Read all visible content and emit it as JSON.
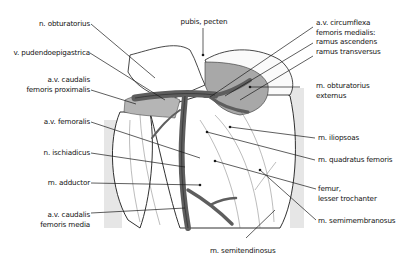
{
  "figure": {
    "type": "anatomical-diagram",
    "colors": {
      "background": "#ffffff",
      "panel_gray": "#e6e6e6",
      "muscle_gray": "#a8a8a8",
      "vessel_dark": "#5e5e5e",
      "outline": "#1a1a1a"
    }
  },
  "labels_left": [
    {
      "id": "n-obturatorius",
      "lines": [
        "n. obturatorius"
      ]
    },
    {
      "id": "v-pudendoepigastrica",
      "lines": [
        "v. pudendoepigastrica"
      ]
    },
    {
      "id": "av-caudalis-femoris-proximalis",
      "lines": [
        "a.v. caudalis",
        "femoris proximalis"
      ]
    },
    {
      "id": "av-femoralis",
      "lines": [
        "a.v. femoralis"
      ]
    },
    {
      "id": "n-ischiadicus",
      "lines": [
        "n. ischiadicus"
      ]
    },
    {
      "id": "m-adductor",
      "lines": [
        "m. adductor"
      ]
    },
    {
      "id": "av-caudalis-femoris-media",
      "lines": [
        "a.v. caudalis",
        "femoris media"
      ]
    }
  ],
  "labels_top": [
    {
      "id": "pubis-pecten",
      "lines": [
        "pubis, pecten"
      ]
    }
  ],
  "labels_right": [
    {
      "id": "av-circumflexa-femoris-medialis",
      "lines": [
        "a.v. circumflexa",
        "femoris medialis:",
        "ramus ascendens",
        "ramus transversus"
      ]
    },
    {
      "id": "m-obturatorius-externus",
      "lines": [
        "m. obturatorius",
        "externus"
      ]
    },
    {
      "id": "m-iliopsoas",
      "lines": [
        "m. iliopsoas"
      ]
    },
    {
      "id": "m-quadratus-femoris",
      "lines": [
        "m. quadratus femoris"
      ]
    },
    {
      "id": "femur-lesser-trochanter",
      "lines": [
        "femur,",
        "lesser trochanter"
      ]
    },
    {
      "id": "m-semimembranosus",
      "lines": [
        "m. semimembranosus"
      ]
    }
  ],
  "labels_bottom": [
    {
      "id": "m-semitendinosus",
      "lines": [
        "m. semitendinosus"
      ]
    }
  ]
}
